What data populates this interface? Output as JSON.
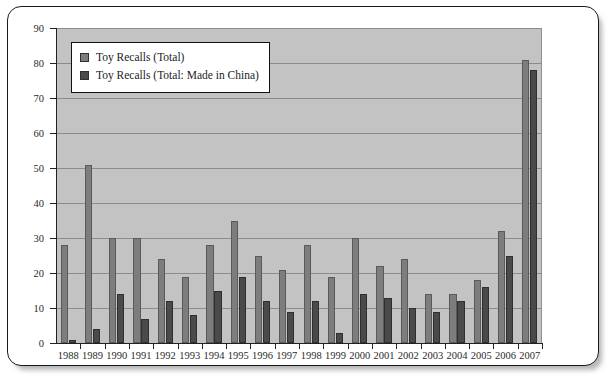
{
  "chart_data": {
    "type": "bar",
    "title": "",
    "xlabel": "",
    "ylabel": "",
    "ylim": [
      0,
      90
    ],
    "ytick_step": 10,
    "yticks": [
      "0",
      "10",
      "20",
      "30",
      "40",
      "50",
      "60",
      "70",
      "80",
      "90"
    ],
    "grid": true,
    "legend_position": "upper-left",
    "categories": [
      "1988",
      "1989",
      "1990",
      "1991",
      "1992",
      "1993",
      "1994",
      "1995",
      "1996",
      "1997",
      "1998",
      "1999",
      "2000",
      "2001",
      "2002",
      "2003",
      "2004",
      "2005",
      "2006",
      "2007"
    ],
    "series": [
      {
        "name": "Toy Recalls (Total)",
        "color": "#7d7d7d",
        "values": [
          28,
          51,
          30,
          30,
          24,
          19,
          28,
          35,
          25,
          21,
          28,
          19,
          30,
          22,
          24,
          14,
          14,
          18,
          32,
          81
        ]
      },
      {
        "name": "Toy Recalls (Total: Made in China)",
        "color": "#4a4a4a",
        "values": [
          1,
          4,
          14,
          7,
          12,
          8,
          15,
          19,
          12,
          9,
          12,
          3,
          14,
          13,
          10,
          9,
          12,
          16,
          25,
          78
        ]
      }
    ]
  },
  "legend": {
    "items": [
      {
        "label": "Toy Recalls (Total)",
        "color": "#7d7d7d"
      },
      {
        "label": "Toy Recalls (Total: Made in China)",
        "color": "#4a4a4a"
      }
    ]
  },
  "colors": {
    "plot_background": "#c3c3c3",
    "gridline": "#8c8c8c",
    "axis": "#222222",
    "frame_border": "#1a1a1a",
    "page_background": "#ffffff"
  }
}
